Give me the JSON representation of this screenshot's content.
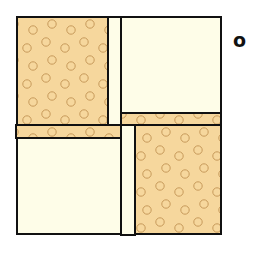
{
  "figure": {
    "label": "o",
    "colors": {
      "patterned_fill": "#f6d79d",
      "dot_stroke": "#c79a5a",
      "plain_fill": "#fefde8",
      "outline": "#111111",
      "background": "#ffffff"
    },
    "pieces": [
      {
        "name": "top-left-patterned-block",
        "type": "patterned",
        "x": 17,
        "y": 17,
        "w": 91,
        "h": 108
      },
      {
        "name": "top-vertical-plain-strip",
        "type": "plain",
        "x": 108,
        "y": 17,
        "w": 13,
        "h": 108
      },
      {
        "name": "top-right-plain-block",
        "type": "plain",
        "x": 121,
        "y": 17,
        "w": 100,
        "h": 96
      },
      {
        "name": "right-horizontal-patterned-band",
        "type": "patterned",
        "x": 121,
        "y": 113,
        "w": 100,
        "h": 12
      },
      {
        "name": "left-horizontal-patterned-band",
        "type": "patterned",
        "x": 16,
        "y": 125,
        "w": 105,
        "h": 13
      },
      {
        "name": "bottom-left-plain-block",
        "type": "plain",
        "x": 17,
        "y": 138,
        "w": 104,
        "h": 96
      },
      {
        "name": "bottom-vertical-plain-strip",
        "type": "plain",
        "x": 121,
        "y": 125,
        "w": 14,
        "h": 110
      },
      {
        "name": "bottom-right-patterned-block",
        "type": "patterned",
        "x": 135,
        "y": 125,
        "w": 86,
        "h": 109
      }
    ]
  }
}
